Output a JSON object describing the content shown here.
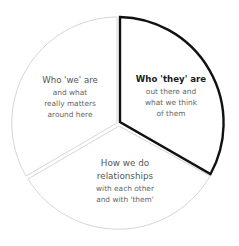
{
  "diagram": {
    "type": "segmented-circle",
    "center": [
      119,
      123
    ],
    "radius": 106,
    "segments": [
      {
        "id": "we",
        "title": "Who 'we' are",
        "description_lines": [
          "and what",
          "really matters",
          "around here"
        ],
        "highlighted": false
      },
      {
        "id": "they",
        "title": "Who 'they' are",
        "description_lines": [
          "out there and",
          "what we think",
          "of them"
        ],
        "highlighted": true
      },
      {
        "id": "relationships",
        "title_lines": [
          "How we do",
          "relationships"
        ],
        "description_lines": [
          "with each other",
          "and with 'them'"
        ],
        "highlighted": false
      }
    ],
    "colors": {
      "background": "#ffffff",
      "outline": "#d4d4d4",
      "highlight_outline": "#111111",
      "title_text": "#555555",
      "highlight_title_text": "#1a1a1a",
      "description_text": "#666666"
    }
  }
}
